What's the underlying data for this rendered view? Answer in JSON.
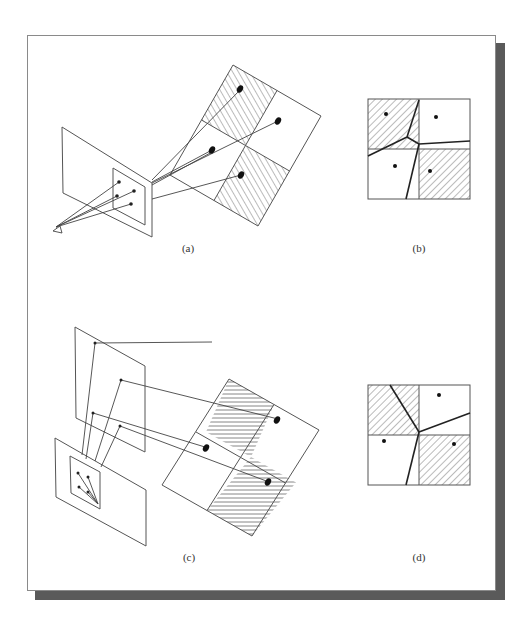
{
  "figure": {
    "panels": [
      {
        "id": "a",
        "label": "(a)",
        "description": "Eye projecting through image plane onto tilted 2x2 checkered surface with sample points"
      },
      {
        "id": "b",
        "label": "(b)",
        "description": "Voronoi partition of 2x2 grid with four sample points"
      },
      {
        "id": "c",
        "label": "(c)",
        "description": "Multiple image planes projecting onto tilted 2x2 grid"
      },
      {
        "id": "d",
        "label": "(d)",
        "description": "Voronoi partition of 2x2 grid with three sample points"
      }
    ],
    "colors": {
      "line": "#444444",
      "hatch": "#555555",
      "shadow": "#5a5a5a",
      "frame": "#8a8a8a"
    }
  }
}
